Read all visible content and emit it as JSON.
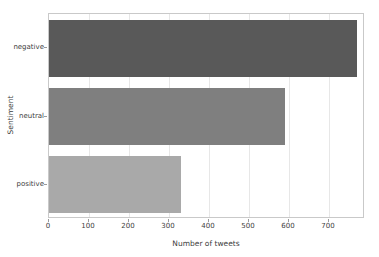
{
  "chart_data": {
    "type": "bar",
    "orientation": "horizontal",
    "title": "",
    "xlabel": "Number of tweets",
    "ylabel": "Sentiment",
    "categories": [
      "negative",
      "neutral",
      "positive"
    ],
    "values": [
      770,
      590,
      330
    ],
    "bar_colors": [
      "#595959",
      "#7f7f7f",
      "#a9a9a9"
    ],
    "xlim": [
      0,
      790
    ],
    "xticks": [
      0,
      100,
      200,
      300,
      400,
      500,
      600,
      700
    ],
    "grid": "vertical-only",
    "legend": "none",
    "colors": {
      "background": "#ffffff",
      "plot_border": "#c9c9c9",
      "gridline": "#e7e7e7",
      "text": "#404040"
    }
  }
}
